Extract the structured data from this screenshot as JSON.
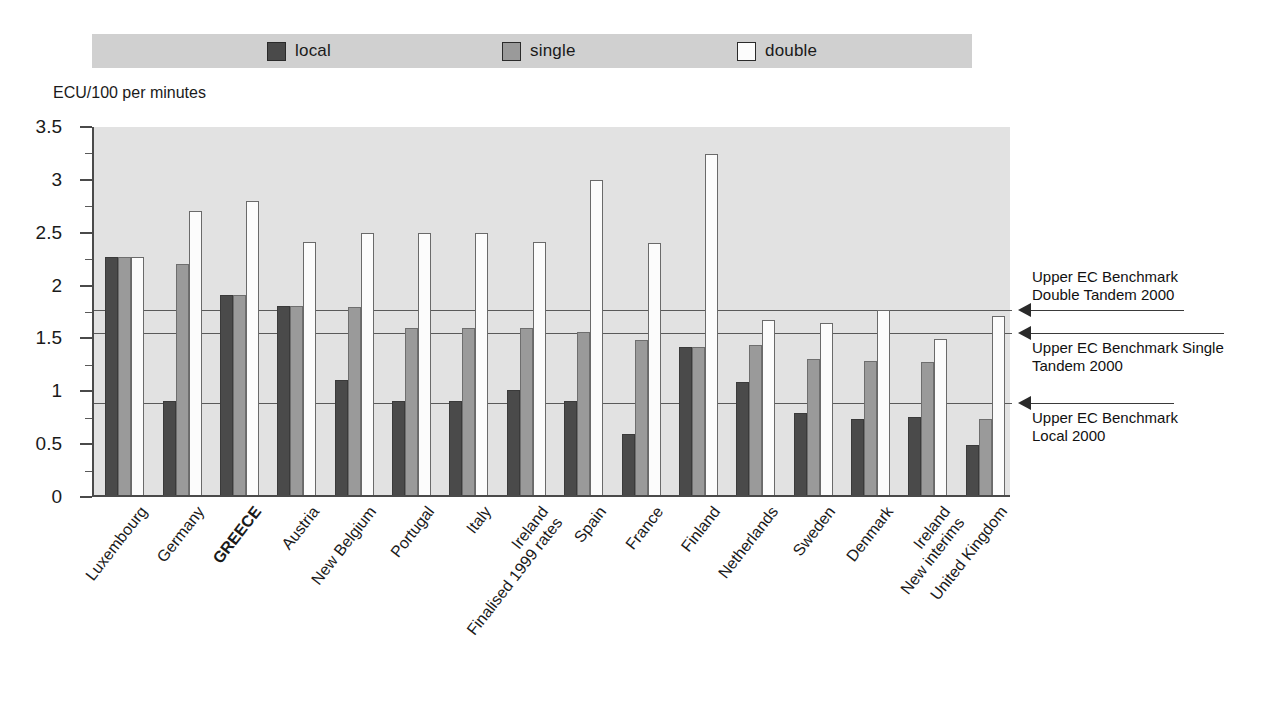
{
  "axis_title": "ECU/100 per minutes",
  "legend": {
    "items": [
      {
        "label": "local",
        "color": "#4a4a4a"
      },
      {
        "label": "single",
        "color": "#9a9a9a"
      },
      {
        "label": "double",
        "color": "#fcfcfc"
      }
    ]
  },
  "annotations": [
    {
      "id": "double-tandem",
      "text": "Upper EC Benchmark\nDouble Tandem 2000",
      "value": 1.77
    },
    {
      "id": "single-tandem",
      "text": "Upper EC Benchmark Single\nTandem 2000",
      "value": 1.55
    },
    {
      "id": "local",
      "text": "Upper EC Benchmark\nLocal 2000",
      "value": 0.89
    }
  ],
  "chart_data": {
    "type": "bar",
    "title": "",
    "xlabel": "",
    "ylabel": "ECU/100 per minutes",
    "ylim": [
      0,
      3.5
    ],
    "ytick_values": [
      0,
      0.5,
      1,
      1.5,
      2,
      2.5,
      3,
      3.5
    ],
    "ytick_labels": [
      "0",
      "0.5",
      "1",
      "1.5",
      "2",
      "2.5",
      "3",
      "3.5"
    ],
    "yminor_step": 0.25,
    "grid": false,
    "legend_position": "top",
    "categories": [
      "Luxembourg",
      "Germany",
      "GREECE",
      "Austria",
      "New Belgium",
      "Portugal",
      "Italy",
      "Ireland\nFinalised 1999 rates",
      "Spain",
      "France",
      "Finland",
      "Netherlands",
      "Sweden",
      "Denmark",
      "Ireland\nNew interims",
      "United Kingdom"
    ],
    "categories_bold": [
      false,
      false,
      true,
      false,
      false,
      false,
      false,
      false,
      false,
      false,
      false,
      false,
      false,
      false,
      false,
      false
    ],
    "series": [
      {
        "name": "local",
        "color": "#4a4a4a",
        "values": [
          2.25,
          0.89,
          1.89,
          1.79,
          1.09,
          0.89,
          0.89,
          0.99,
          0.89,
          0.58,
          1.4,
          1.07,
          0.78,
          0.72,
          0.74,
          0.47
        ]
      },
      {
        "name": "single",
        "color": "#9a9a9a",
        "values": [
          2.25,
          2.19,
          1.89,
          1.79,
          1.78,
          1.58,
          1.58,
          1.58,
          1.54,
          1.47,
          1.4,
          1.42,
          1.29,
          1.27,
          1.26,
          0.72
        ]
      },
      {
        "name": "double",
        "color": "#fcfcfc",
        "values": [
          2.25,
          2.69,
          2.78,
          2.39,
          2.48,
          2.48,
          2.48,
          2.39,
          2.98,
          2.38,
          3.23,
          1.66,
          1.63,
          1.75,
          1.48,
          1.69
        ]
      }
    ],
    "reference_lines": [
      {
        "label": "Upper EC Benchmark Double Tandem 2000",
        "value": 1.77
      },
      {
        "label": "Upper EC Benchmark Single Tandem 2000",
        "value": 1.55
      },
      {
        "label": "Upper EC Benchmark Local 2000",
        "value": 0.89
      }
    ]
  }
}
